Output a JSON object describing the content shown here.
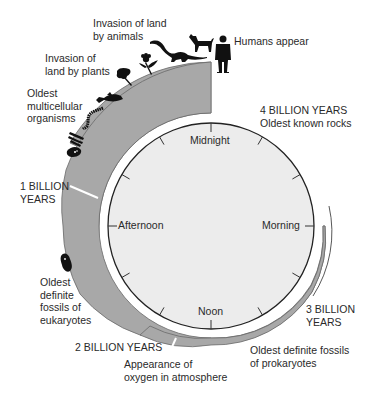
{
  "diagram": {
    "clock": {
      "top": "Midnight",
      "right": "Morning",
      "bottom": "Noon",
      "left": "Afternoon"
    },
    "milestones": {
      "one_billion": [
        "1 BILLION",
        "YEARS"
      ],
      "two_billion": "2 BILLION YEARS",
      "three_billion": [
        "3 BILLION",
        "YEARS"
      ],
      "four_billion": [
        "4 BILLION YEARS",
        "Oldest known rocks"
      ]
    },
    "events": {
      "humans": "Humans appear",
      "animals": [
        "Invasion of land",
        "by animals"
      ],
      "plants": [
        "Invasion of",
        "land by plants"
      ],
      "multicellular": [
        "Oldest",
        "multicellular",
        "organisms"
      ],
      "eukaryotes": [
        "Oldest",
        "definite",
        "fossils of",
        "eukaryotes"
      ],
      "oxygen": [
        "Appearance of",
        "oxygen in atmosphere"
      ],
      "prokaryotes": [
        "Oldest definite fossils",
        "of prokaryotes"
      ]
    },
    "icons": [
      "human-silhouette-icon",
      "dog-silhouette-icon",
      "dinosaur-silhouette-icon",
      "flower-plant-icon",
      "tree-fern-icon",
      "fish-icon",
      "worm-icon",
      "seaweed-icon",
      "jellyfish-icon",
      "eukaryote-cell-icon"
    ],
    "colors": {
      "band": "#a8a8a8",
      "band_stroke": "#6a6a6a",
      "clock_face": "#ececec",
      "clock_stroke": "#222222",
      "silhouette": "#111111",
      "text": "#2a2a2a"
    }
  }
}
